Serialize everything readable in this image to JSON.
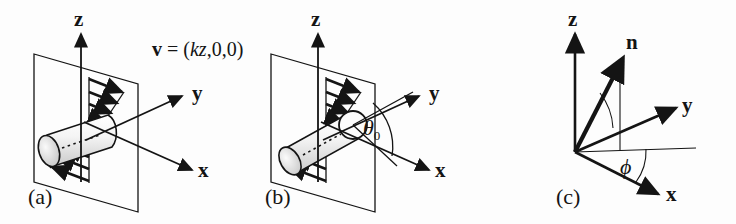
{
  "figure": {
    "background_color": "#fdfdfd",
    "ink_color": "#141414"
  },
  "equation": {
    "vector_symbol": "v",
    "equals": "=",
    "open_paren": "(",
    "component_1": "kz",
    "component_2": "0",
    "component_3": "0",
    "close_paren": ")",
    "separator": ","
  },
  "panels": [
    {
      "id": "a",
      "label": "(a)",
      "axes": [
        {
          "name": "z-axis",
          "label": "z"
        },
        {
          "name": "y-axis",
          "label": "y"
        },
        {
          "name": "x-axis",
          "label": "x"
        }
      ],
      "elements": [
        "shear-plane",
        "velocity-profile-arrows",
        "cylinder-rod"
      ]
    },
    {
      "id": "b",
      "label": "(b)",
      "axes": [
        {
          "name": "z-axis",
          "label": "z"
        },
        {
          "name": "y-axis",
          "label": "y"
        },
        {
          "name": "x-axis",
          "label": "x"
        }
      ],
      "angle": {
        "symbol": "θ",
        "subscript": "0"
      },
      "elements": [
        "shear-plane",
        "velocity-profile-arrows",
        "cylinder-rod",
        "theta-zero-arc"
      ]
    },
    {
      "id": "c",
      "label": "(c)",
      "axes": [
        {
          "name": "z-axis",
          "label": "z"
        },
        {
          "name": "y-axis",
          "label": "y"
        },
        {
          "name": "x-axis",
          "label": "x"
        }
      ],
      "director": {
        "label": "n"
      },
      "angle": {
        "symbol": "ϕ"
      },
      "elements": [
        "director-vector",
        "polar-angle-arc",
        "azimuthal-angle-arc",
        "projection-line",
        "reference-line"
      ]
    }
  ]
}
